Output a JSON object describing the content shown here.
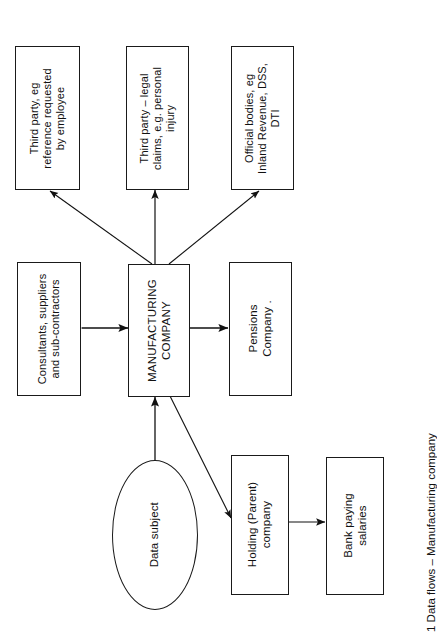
{
  "figure": {
    "caption": "1 Data flows – Manufacturing company",
    "orientation": "rotated-90-ccw",
    "background": "#ffffff",
    "stroke": "#1a1a1a"
  },
  "nodes": {
    "third_party_reference": "Third party, eg\nreference requested\nby employee",
    "third_party_legal": "Third party – legal\nclaims, e.g. personal\ninjury",
    "official_bodies": "Official bodies, eg\nInland Revenue, DSS,\nDTI",
    "consultants": "Consultants, suppliers\nand sub-contractors",
    "manufacturing_company": "MANUFACTURING\nCOMPANY",
    "pensions_company": "Pensions\nCompany .",
    "data_subject": "Data subject",
    "holding_company": "Holding (Parent)\ncompany",
    "bank": "Bank paying\nsalaries"
  },
  "edges": [
    {
      "id": "mfg-to-third-party-reference",
      "from": "manufacturing_company",
      "to": "third_party_reference",
      "heads": "one"
    },
    {
      "id": "mfg-to-third-party-legal",
      "from": "manufacturing_company",
      "to": "third_party_legal",
      "heads": "one"
    },
    {
      "id": "mfg-to-official-bodies",
      "from": "manufacturing_company",
      "to": "official_bodies",
      "heads": "one"
    },
    {
      "id": "consultants-to-mfg",
      "from": "consultants",
      "to": "manufacturing_company",
      "heads": "both"
    },
    {
      "id": "mfg-to-pensions",
      "from": "manufacturing_company",
      "to": "pensions_company",
      "heads": "one"
    },
    {
      "id": "data-subject-to-mfg",
      "from": "data_subject",
      "to": "manufacturing_company",
      "heads": "one"
    },
    {
      "id": "mfg-to-holding",
      "from": "manufacturing_company",
      "to": "holding_company",
      "heads": "one"
    },
    {
      "id": "holding-to-bank",
      "from": "holding_company",
      "to": "bank",
      "heads": "one"
    }
  ]
}
